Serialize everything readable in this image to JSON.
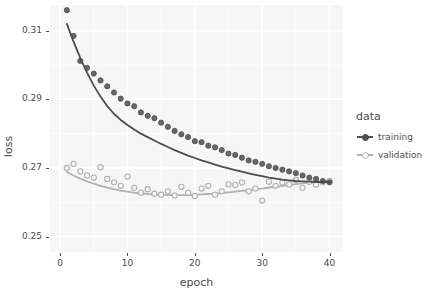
{
  "chart_data": {
    "type": "scatter",
    "title": "",
    "xlabel": "epoch",
    "ylabel": "loss",
    "xlim": [
      -1.5,
      42
    ],
    "ylim": [
      0.2455,
      0.3175
    ],
    "xticks": [
      0,
      10,
      20,
      30,
      40
    ],
    "xtick_labels": [
      "0",
      "10",
      "20",
      "30",
      "40"
    ],
    "yticks": [
      0.25,
      0.27,
      0.29,
      0.31
    ],
    "ytick_labels": [
      "0.25",
      "0.27",
      "0.29",
      "0.31"
    ],
    "grid": true,
    "grid_color": "#ffffff",
    "panel_color": "#f6f6f6",
    "legend": {
      "title": "data",
      "position": "right",
      "entries": [
        {
          "label": "training",
          "color": "#4d4d4d",
          "marker": "filled-circle"
        },
        {
          "label": "validation",
          "color": "#b0b0b0",
          "marker": "hollow-circle"
        }
      ]
    },
    "series": [
      {
        "name": "training",
        "color": "#4d4d4d",
        "x": [
          1,
          2,
          3,
          4,
          5,
          6,
          7,
          8,
          9,
          10,
          11,
          12,
          13,
          14,
          15,
          16,
          17,
          18,
          19,
          20,
          21,
          22,
          23,
          24,
          25,
          26,
          27,
          28,
          29,
          30,
          31,
          32,
          33,
          34,
          35,
          36,
          37,
          38,
          39,
          40
        ],
        "y": [
          0.316,
          0.3085,
          0.3012,
          0.2992,
          0.2975,
          0.2955,
          0.2938,
          0.292,
          0.2902,
          0.2888,
          0.288,
          0.2862,
          0.2852,
          0.2845,
          0.2832,
          0.282,
          0.2808,
          0.2798,
          0.279,
          0.2778,
          0.2775,
          0.2765,
          0.276,
          0.2752,
          0.2742,
          0.2738,
          0.273,
          0.2722,
          0.2718,
          0.2712,
          0.2705,
          0.27,
          0.2695,
          0.269,
          0.2685,
          0.2678,
          0.2672,
          0.2668,
          0.2662,
          0.2658
        ],
        "smooth_y": [
          0.312,
          0.3068,
          0.302,
          0.2978,
          0.294,
          0.2908,
          0.288,
          0.2858,
          0.284,
          0.2825,
          0.2812,
          0.28,
          0.279,
          0.278,
          0.277,
          0.2761,
          0.2752,
          0.2744,
          0.2736,
          0.2729,
          0.2722,
          0.2716,
          0.271,
          0.2704,
          0.2699,
          0.2694,
          0.2689,
          0.2684,
          0.268,
          0.2676,
          0.2672,
          0.2669,
          0.2666,
          0.2664,
          0.2662,
          0.2661,
          0.266,
          0.2659,
          0.2659,
          0.2659
        ]
      },
      {
        "name": "validation",
        "color": "#b0b0b0",
        "x": [
          1,
          2,
          3,
          4,
          5,
          6,
          7,
          8,
          9,
          10,
          11,
          12,
          13,
          14,
          15,
          16,
          17,
          18,
          19,
          20,
          21,
          22,
          23,
          24,
          25,
          26,
          27,
          28,
          29,
          30,
          31,
          32,
          33,
          34,
          35,
          36,
          37,
          38,
          39,
          40
        ],
        "y": [
          0.27,
          0.2712,
          0.269,
          0.2678,
          0.2672,
          0.2702,
          0.2668,
          0.2658,
          0.2648,
          0.2675,
          0.2642,
          0.2628,
          0.2638,
          0.2625,
          0.2622,
          0.2632,
          0.262,
          0.2645,
          0.2628,
          0.2618,
          0.264,
          0.2648,
          0.2622,
          0.2632,
          0.2652,
          0.265,
          0.2658,
          0.2632,
          0.264,
          0.2605,
          0.266,
          0.2648,
          0.2658,
          0.2652,
          0.2665,
          0.2642,
          0.266,
          0.2652,
          0.2658,
          0.2662
        ],
        "smooth_y": [
          0.2688,
          0.2678,
          0.2669,
          0.2661,
          0.2654,
          0.2648,
          0.2643,
          0.2638,
          0.2634,
          0.2631,
          0.2628,
          0.2626,
          0.2624,
          0.2623,
          0.2622,
          0.2621,
          0.2621,
          0.2621,
          0.2621,
          0.2622,
          0.2623,
          0.2624,
          0.2625,
          0.2627,
          0.2629,
          0.2631,
          0.2633,
          0.2635,
          0.2638,
          0.264,
          0.2643,
          0.2645,
          0.2648,
          0.265,
          0.2653,
          0.2655,
          0.2657,
          0.2659,
          0.2661,
          0.2663
        ]
      }
    ],
    "outliers": [
      {
        "series": "training",
        "x": 1,
        "y": 0.316
      }
    ]
  }
}
